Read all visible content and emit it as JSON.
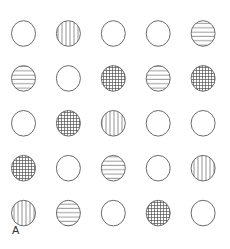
{
  "figure": {
    "label": "A",
    "rows": 5,
    "cols": 5,
    "stroke_color": "#6b6b6b",
    "grid": [
      [
        "empty",
        "vertical",
        "empty",
        "empty",
        "horizontal"
      ],
      [
        "horizontal",
        "empty",
        "grid",
        "horizontal",
        "grid"
      ],
      [
        "empty",
        "grid",
        "vertical",
        "empty",
        "empty"
      ],
      [
        "grid",
        "empty",
        "horizontal",
        "empty",
        "vertical"
      ],
      [
        "vertical",
        "horizontal",
        "empty",
        "grid",
        "empty"
      ]
    ]
  }
}
